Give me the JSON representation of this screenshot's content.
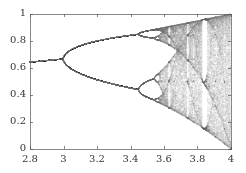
{
  "chart_data": {
    "type": "scatter",
    "title": "",
    "subtitle": "",
    "xlabel": "",
    "ylabel": "",
    "xlim": [
      2.8,
      4.0
    ],
    "ylim": [
      0,
      1
    ],
    "xticks": [
      2.8,
      3.0,
      3.2,
      3.4,
      3.6,
      3.8,
      4.0
    ],
    "xtick_labels": [
      "2.8",
      "3",
      "3.2",
      "3.4",
      "3.6",
      "3.8",
      "4"
    ],
    "yticks": [
      0,
      0.2,
      0.4,
      0.6,
      0.8,
      1.0
    ],
    "ytick_labels": [
      "0",
      "0.2",
      "0.4",
      "0.6",
      "0.8",
      "1"
    ],
    "grid": false,
    "legend": null,
    "series": [
      {
        "name": "logistic map attractor",
        "model": "x_{n+1} = r * x_n * (1 - x_n)",
        "r_range": [
          2.8,
          4.0
        ],
        "x0": 0.5,
        "transient_iterations": 300,
        "plotted_iterations": 120,
        "color": "#8a8a8a",
        "key_points": [
          {
            "r": 2.8,
            "x": [
              0.643
            ]
          },
          {
            "r": 3.0,
            "x": [
              0.667
            ]
          },
          {
            "r": 3.2,
            "x": [
              0.513,
              0.799
            ]
          },
          {
            "r": 3.4,
            "x": [
              0.452,
              0.842
            ]
          },
          {
            "r": 3.5,
            "x": [
              0.383,
              0.501,
              0.827,
              0.875
            ]
          },
          {
            "r": 3.57,
            "note": "onset of chaos"
          },
          {
            "r": 3.83,
            "note": "period-3 window"
          },
          {
            "r": 4.0,
            "x_range": [
              0,
              1
            ]
          }
        ]
      }
    ]
  },
  "frame": {
    "left": 30,
    "top": 14,
    "right": 231,
    "bottom": 149,
    "axis_color": "#555555"
  }
}
